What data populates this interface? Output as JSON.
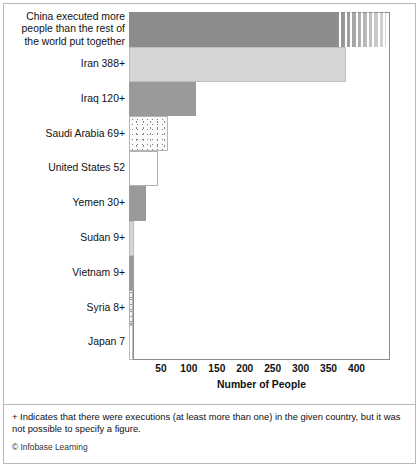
{
  "chart_data": {
    "type": "bar",
    "orientation": "horizontal",
    "title": "",
    "xlabel": "Number of People",
    "ylabel": "",
    "xlim": [
      0,
      460
    ],
    "xticks": [
      50,
      100,
      150,
      200,
      250,
      300,
      350,
      400
    ],
    "grid": false,
    "legend": null,
    "categories": [
      "China executed more\npeople than the rest of\nthe world put together",
      "Iran 388+",
      "Iraq 120+",
      "Saudi Arabia 69+",
      "United States 52",
      "Yemen 30+",
      "Sudan 9+",
      "Vietnam 9+",
      "Syria 8+",
      "Japan 7"
    ],
    "values": [
      460,
      388,
      120,
      69,
      52,
      30,
      9,
      9,
      8,
      7
    ],
    "bars": [
      {
        "label": "China executed more\npeople than the rest of\nthe world put together",
        "country": "China",
        "value": 460,
        "value_text": "",
        "style": "fill-dark",
        "off_scale": true
      },
      {
        "label": "Iran 388+",
        "country": "Iran",
        "value": 388,
        "value_text": "388+",
        "style": "fill-light",
        "off_scale": false
      },
      {
        "label": "Iraq 120+",
        "country": "Iraq",
        "value": 120,
        "value_text": "120+",
        "style": "fill-mid",
        "off_scale": false
      },
      {
        "label": "Saudi Arabia 69+",
        "country": "Saudi Arabia",
        "value": 69,
        "value_text": "69+",
        "style": "fill-dots",
        "off_scale": false
      },
      {
        "label": "United States 52",
        "country": "United States",
        "value": 52,
        "value_text": "52",
        "style": "fill-white",
        "off_scale": false
      },
      {
        "label": "Yemen 30+",
        "country": "Yemen",
        "value": 30,
        "value_text": "30+",
        "style": "fill-mid",
        "off_scale": false
      },
      {
        "label": "Sudan 9+",
        "country": "Sudan",
        "value": 9,
        "value_text": "9+",
        "style": "fill-light",
        "off_scale": false
      },
      {
        "label": "Vietnam 9+",
        "country": "Vietnam",
        "value": 9,
        "value_text": "9+",
        "style": "fill-mid",
        "off_scale": false
      },
      {
        "label": "Syria 8+",
        "country": "Syria",
        "value": 8,
        "value_text": "8+",
        "style": "fill-hatch",
        "off_scale": false
      },
      {
        "label": "Japan 7",
        "country": "Japan",
        "value": 7,
        "value_text": "7",
        "style": "fill-sliver",
        "off_scale": false
      }
    ],
    "annotation": "China executed more people than the rest of the world put together"
  },
  "notes": {
    "footnote": "+ Indicates that there were executions (at least more than one) in the given country, but it was not possible to specify a figure.",
    "copyright": "© Infobase Learning"
  },
  "colors": {
    "bar_dark": "#8c8c8c",
    "bar_mid": "#9a9a9a",
    "bar_light": "#d5d5d5",
    "frame": "#8b8b8b",
    "page_border": "#b9b9b9",
    "text": "#111111"
  }
}
